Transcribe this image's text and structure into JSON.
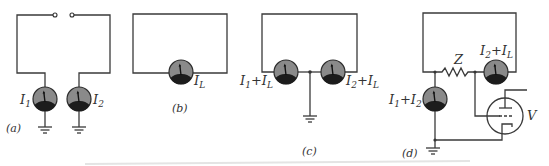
{
  "figure": {
    "panels": [
      {
        "id": "a",
        "caption": "(a)",
        "meters": [
          {
            "label_main": "I",
            "label_sub": "1"
          },
          {
            "label_main": "I",
            "label_sub": "2"
          }
        ]
      },
      {
        "id": "b",
        "caption": "(b)",
        "meters": [
          {
            "label_main": "I",
            "label_sub": "L"
          }
        ]
      },
      {
        "id": "c",
        "caption": "(c)",
        "meters": [
          {
            "label_a": "I",
            "label_a_sub": "1",
            "plus": "+",
            "label_b": "I",
            "label_b_sub": "L"
          },
          {
            "label_a": "I",
            "label_a_sub": "2",
            "plus": "+",
            "label_b": "I",
            "label_b_sub": "L"
          }
        ]
      },
      {
        "id": "d",
        "caption": "(d)",
        "resistor_label": "Z",
        "tube_label": "V",
        "meters": [
          {
            "label_a": "I",
            "label_a_sub": "1",
            "plus": "+",
            "label_b": "I",
            "label_b_sub": "2"
          },
          {
            "label_a": "I",
            "label_a_sub": "2",
            "plus": "+",
            "label_b": "I",
            "label_b_sub": "L"
          }
        ]
      }
    ],
    "colors": {
      "wire": "#3a3a3a",
      "meter_body": "#8a8a8a",
      "meter_base": "#1c1c1c",
      "background": "#ffffff"
    }
  }
}
